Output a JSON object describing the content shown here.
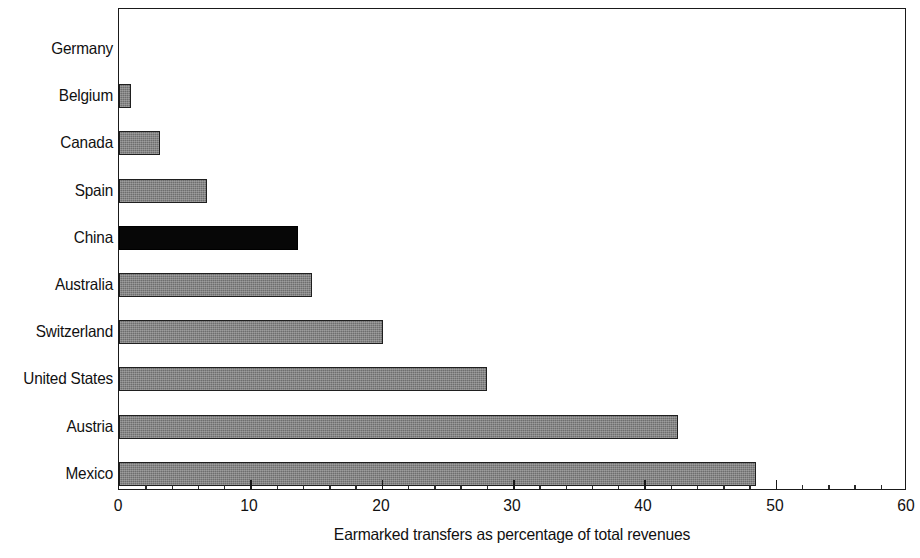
{
  "chart_data": {
    "type": "bar",
    "orientation": "horizontal",
    "title": "",
    "xlabel": "Earmarked transfers as percentage of total revenues",
    "ylabel": "",
    "xlim": [
      0,
      60
    ],
    "xticks": [
      0,
      10,
      20,
      30,
      40,
      50,
      60
    ],
    "xtick_labels": [
      "0",
      "10",
      "20",
      "30",
      "40",
      "50",
      "60"
    ],
    "minor_tick_step": 2,
    "grid": false,
    "legend": null,
    "categories": [
      "Germany",
      "Belgium",
      "Canada",
      "Spain",
      "China",
      "Australia",
      "Switzerland",
      "United States",
      "Austria",
      "Mexico"
    ],
    "values": [
      0,
      0.9,
      3.1,
      6.7,
      13.6,
      14.7,
      20.1,
      28.0,
      42.6,
      48.5
    ],
    "highlight_category": "China",
    "colors": {
      "bar_default": "#6e6e6e",
      "bar_highlight": "#070707",
      "bar_outline": "#1f1f1f",
      "axis": "#1a1a1a",
      "text": "#111111",
      "background": "#ffffff"
    },
    "bars": [
      {
        "label": "Germany",
        "value": 0,
        "style": "zero"
      },
      {
        "label": "Belgium",
        "value": 0.9,
        "style": "gray"
      },
      {
        "label": "Canada",
        "value": 3.1,
        "style": "gray"
      },
      {
        "label": "Spain",
        "value": 6.7,
        "style": "gray"
      },
      {
        "label": "China",
        "value": 13.6,
        "style": "black"
      },
      {
        "label": "Australia",
        "value": 14.7,
        "style": "gray"
      },
      {
        "label": "Switzerland",
        "value": 20.1,
        "style": "gray"
      },
      {
        "label": "United States",
        "value": 28.0,
        "style": "gray"
      },
      {
        "label": "Austria",
        "value": 42.6,
        "style": "gray"
      },
      {
        "label": "Mexico",
        "value": 48.5,
        "style": "gray"
      }
    ]
  }
}
